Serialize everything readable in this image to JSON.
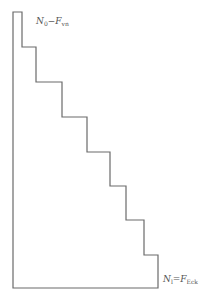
{
  "diagram": {
    "type": "staircase-outline",
    "stroke_color": "#6a6a6a",
    "points": [
      [
        13,
        12
      ],
      [
        22,
        12
      ],
      [
        22,
        47
      ],
      [
        36,
        47
      ],
      [
        36,
        82
      ],
      [
        62,
        82
      ],
      [
        62,
        117
      ],
      [
        87,
        117
      ],
      [
        87,
        152
      ],
      [
        110,
        152
      ],
      [
        110,
        186
      ],
      [
        126,
        186
      ],
      [
        126,
        220
      ],
      [
        144,
        220
      ],
      [
        144,
        255
      ],
      [
        158,
        255
      ],
      [
        158,
        288
      ],
      [
        13,
        288
      ]
    ],
    "labels": {
      "top": {
        "main": "N",
        "main_sub": "0",
        "sep": "−",
        "rhs": "F",
        "rhs_sub": "vn"
      },
      "bottom": {
        "main": "N",
        "main_sub": "l",
        "sep": "=",
        "rhs": "F",
        "rhs_sub": "Eck"
      }
    }
  }
}
